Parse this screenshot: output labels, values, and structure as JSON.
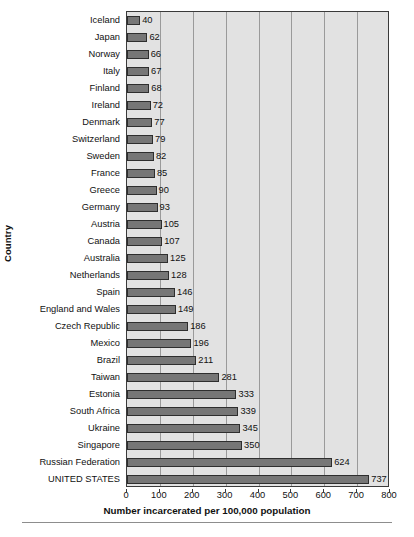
{
  "chart_data": {
    "type": "bar",
    "orientation": "horizontal",
    "title": "",
    "xlabel": "Number incarcerated per 100,000 population",
    "ylabel": "Country",
    "xlim": [
      0,
      800
    ],
    "xticks": [
      0,
      100,
      200,
      300,
      400,
      500,
      600,
      700,
      800
    ],
    "grid": true,
    "legend": false,
    "categories": [
      "Iceland",
      "Japan",
      "Norway",
      "Italy",
      "Finland",
      "Ireland",
      "Denmark",
      "Switzerland",
      "Sweden",
      "France",
      "Greece",
      "Germany",
      "Austria",
      "Canada",
      "Australia",
      "Netherlands",
      "Spain",
      "England and Wales",
      "Czech Republic",
      "Mexico",
      "Brazil",
      "Taiwan",
      "Estonia",
      "South Africa",
      "Ukraine",
      "Singapore",
      "Russian Federation",
      "UNITED STATES"
    ],
    "values": [
      40,
      62,
      66,
      67,
      68,
      72,
      77,
      79,
      82,
      85,
      90,
      93,
      105,
      107,
      125,
      128,
      146,
      149,
      186,
      196,
      211,
      281,
      333,
      339,
      345,
      350,
      624,
      737
    ],
    "colors": {
      "bar_fill": "#767676",
      "bar_border": "#2e2e2e",
      "plot_background": "#e2e2e2",
      "gridline": "#9a9a9a",
      "axis": "#3a3a3a",
      "page_background": "#ffffff",
      "text": "#111111"
    }
  }
}
